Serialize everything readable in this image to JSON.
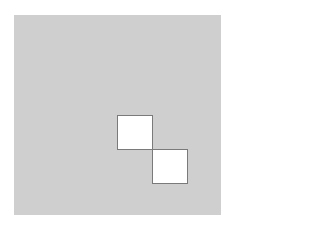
{
  "diagram": {
    "background_color": "#ffffff",
    "board": {
      "x": 14,
      "y": 15,
      "width": 207,
      "height": 200,
      "color": "#cfcfcf"
    },
    "cells": [
      {
        "x": 117,
        "y": 115,
        "width": 36,
        "height": 35,
        "fill": "#ffffff",
        "stroke": "#7a7a7a"
      },
      {
        "x": 152,
        "y": 149,
        "width": 36,
        "height": 35,
        "fill": "#ffffff",
        "stroke": "#7a7a7a"
      }
    ]
  }
}
